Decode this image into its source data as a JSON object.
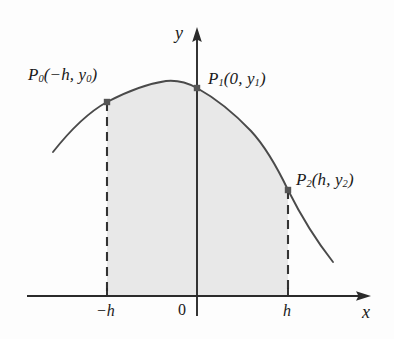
{
  "figure": {
    "background_color": "#fdfdfd",
    "curve_color": "#4a4a4a",
    "axis_color": "#2b2b2b",
    "shade_color": "#e8e8e8",
    "point_color": "#555555",
    "dash_color": "#333333"
  },
  "axes": {
    "x_label": "x",
    "y_label": "y",
    "x_axis_y_px": 296,
    "y_axis_x_px": 197,
    "x_arrow_tip_px": 371,
    "y_arrow_tip_px": 27,
    "ticks": [
      {
        "name": "tick-neg-h",
        "label": "−h",
        "x_px": 107
      },
      {
        "name": "tick-origin",
        "label": "0",
        "x_px": 197
      },
      {
        "name": "tick-h",
        "label": "h",
        "x_px": 288
      }
    ]
  },
  "points": [
    {
      "id": "p0",
      "label_html": "P<sub>0</sub>(−h, y<sub>0</sub>)",
      "label_text": "P0(-h, y0)",
      "x_px": 107,
      "y_px": 102,
      "math_x": "-h",
      "math_y": "y_0"
    },
    {
      "id": "p1",
      "label_html": "P<sub>1</sub>(0, y<sub>1</sub>)",
      "label_text": "P1(0, y1)",
      "x_px": 197,
      "y_px": 88,
      "math_x": "0",
      "math_y": "y_1"
    },
    {
      "id": "p2",
      "label_html": "P<sub>2</sub>(h, y<sub>2</sub>)",
      "label_text": "P2(h, y2)",
      "x_px": 288,
      "y_px": 190,
      "math_x": "h",
      "math_y": "y_2"
    }
  ],
  "chart_data": {
    "type": "line",
    "xlabel": "x",
    "ylabel": "y",
    "grid": false,
    "legend": null,
    "xlim_px": [
      53,
      371
    ],
    "ylim_px": [
      296,
      27
    ],
    "shaded_region": {
      "label": "area under parabola from -h to h",
      "x_from_px": 107,
      "x_to_px": 288,
      "fill": "#e8e8e8"
    },
    "series": [
      {
        "name": "parabola",
        "points_px": [
          [
            53,
            152
          ],
          [
            70,
            131
          ],
          [
            88,
            114
          ],
          [
            107,
            102
          ],
          [
            126,
            92
          ],
          [
            146,
            84
          ],
          [
            166,
            81
          ],
          [
            180,
            81
          ],
          [
            197,
            88
          ],
          [
            215,
            98
          ],
          [
            233,
            112
          ],
          [
            251,
            131
          ],
          [
            270,
            158
          ],
          [
            288,
            190
          ],
          [
            305,
            219
          ],
          [
            320,
            243
          ],
          [
            333,
            262
          ]
        ]
      }
    ],
    "markers": [
      {
        "name": "p0-marker",
        "x_px": 107,
        "y_px": 102
      },
      {
        "name": "p1-marker",
        "x_px": 197,
        "y_px": 88
      },
      {
        "name": "p2-marker",
        "x_px": 288,
        "y_px": 190
      }
    ],
    "dashed_verticals": [
      {
        "name": "dash-neg-h",
        "x_px": 107,
        "y_top_px": 102,
        "y_bottom_px": 296
      },
      {
        "name": "dash-h",
        "x_px": 288,
        "y_top_px": 190,
        "y_bottom_px": 296
      }
    ]
  }
}
